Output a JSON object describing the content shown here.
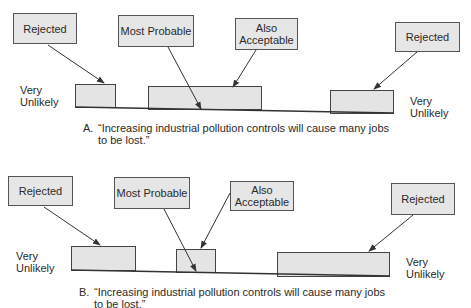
{
  "diagrams": [
    {
      "id": "A",
      "labels": {
        "rejected_left": "Rejected",
        "most_probable": "Most Probable",
        "also_acceptable": "Also\nAcceptable",
        "rejected_right": "Rejected"
      },
      "ends": {
        "left": "Very\nUnlikely",
        "right": "Very\nUnlikely"
      },
      "caption": {
        "letter": "A.",
        "line1": "“Increasing industrial pollution controls will cause many jobs",
        "line2": "to be lost.”"
      }
    },
    {
      "id": "B",
      "labels": {
        "rejected_left": "Rejected",
        "most_probable": "Most Probable",
        "also_acceptable": "Also\nAcceptable",
        "rejected_right": "Rejected"
      },
      "ends": {
        "left": "Very\nUnlikely",
        "right": "Very\nUnlikely"
      },
      "caption": {
        "letter": "B.",
        "line1": "“Increasing industrial pollution controls will cause many jobs",
        "line2": "to be lost.”"
      }
    }
  ],
  "colors": {
    "box_fill": "#e6e6e6",
    "outline": "#444444",
    "text": "#2a2a2a"
  }
}
